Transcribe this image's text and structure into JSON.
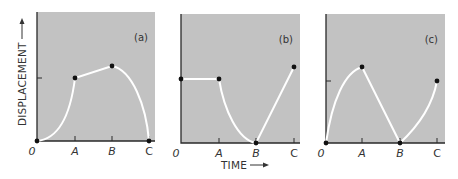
{
  "figure": {
    "y_axis_title": "DISPLACEMENT",
    "x_axis_title": "TIME",
    "origin_label": "0",
    "colors": {
      "panel_bg": "#c2c2c2",
      "curve": "#ffffff",
      "axis": "#2a2a2a",
      "point": "#111111"
    }
  },
  "chart_data": [
    {
      "type": "line",
      "title": "(a)",
      "xlabel": "TIME",
      "ylabel": "DISPLACEMENT",
      "x_ticks": [
        "0",
        "A",
        "B",
        "C"
      ],
      "ylim": [
        0,
        1.6
      ],
      "y_ticks": [
        1.0
      ],
      "points": [
        {
          "x": "0",
          "y": 0.0
        },
        {
          "x": "A",
          "y": 1.0
        },
        {
          "x": "B",
          "y": 1.18
        },
        {
          "x": "C",
          "y": 0.0
        }
      ],
      "segments": [
        "0-A: curved, accelerating upward",
        "A-B: straight line",
        "B-C: curved, accelerating downward"
      ]
    },
    {
      "type": "line",
      "title": "(b)",
      "xlabel": "TIME",
      "ylabel": "DISPLACEMENT",
      "x_ticks": [
        "0",
        "A",
        "B",
        "C"
      ],
      "ylim": [
        0,
        1.6
      ],
      "y_ticks": [
        1.0
      ],
      "points": [
        {
          "x": "0",
          "y": 1.0
        },
        {
          "x": "A",
          "y": 1.0
        },
        {
          "x": "B",
          "y": 0.0
        },
        {
          "x": "C",
          "y": 1.18
        }
      ],
      "segments": [
        "0-A: horizontal line",
        "A-B: curved, decelerating to zero",
        "B-C: straight line"
      ]
    },
    {
      "type": "line",
      "title": "(c)",
      "xlabel": "TIME",
      "ylabel": "DISPLACEMENT",
      "x_ticks": [
        "0",
        "A",
        "B",
        "C"
      ],
      "ylim": [
        0,
        1.6
      ],
      "y_ticks": [
        1.0
      ],
      "points": [
        {
          "x": "0",
          "y": 0.0
        },
        {
          "x": "A",
          "y": 1.18
        },
        {
          "x": "B",
          "y": 0.0
        },
        {
          "x": "C",
          "y": 1.0
        }
      ],
      "segments": [
        "0-A: curved, decelerating upward",
        "A-B: straight line",
        "B-C: curved, accelerating upward"
      ]
    }
  ],
  "panels": [
    {
      "label": "(a)",
      "ticks": {
        "origin": "0",
        "a": "A",
        "b": "B",
        "c": "C"
      },
      "box": {
        "x": 37,
        "y": 12,
        "w": 118,
        "h": 129
      },
      "tick_x": [
        37,
        75,
        112,
        149
      ],
      "y_tick": 78,
      "path": "M37,141 C58,139 70,118 75,78 L112,66 C132,70 146,105 149,141",
      "dots": [
        [
          75,
          78
        ],
        [
          112,
          66
        ],
        [
          149,
          141
        ],
        [
          37,
          141
        ]
      ]
    },
    {
      "label": "(b)",
      "ticks": {
        "origin": "0",
        "a": "A",
        "b": "B",
        "c": "C"
      },
      "box": {
        "x": 181,
        "y": 14,
        "w": 119,
        "h": 129
      },
      "tick_x": [
        181,
        219,
        256,
        294
      ],
      "y_tick": 79,
      "path": "M181,79 L219,79 C224,110 238,140 256,143 L294,67",
      "dots": [
        [
          181,
          79
        ],
        [
          219,
          79
        ],
        [
          256,
          143
        ],
        [
          294,
          67
        ]
      ]
    },
    {
      "label": "(c)",
      "ticks": {
        "origin": "0",
        "a": "A",
        "b": "B",
        "c": "C"
      },
      "box": {
        "x": 326,
        "y": 14,
        "w": 119,
        "h": 129
      },
      "tick_x": [
        326,
        362,
        400,
        437
      ],
      "y_tick": 81,
      "path": "M326,143 C332,100 345,72 362,67 L400,143 C414,130 432,108 437,81",
      "dots": [
        [
          326,
          143
        ],
        [
          362,
          67
        ],
        [
          400,
          143
        ],
        [
          437,
          81
        ]
      ]
    }
  ]
}
